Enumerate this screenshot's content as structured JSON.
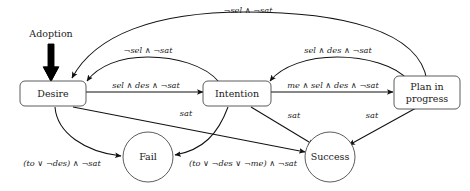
{
  "diagram": {
    "entry": {
      "label": "Adoption",
      "target": "Desire"
    },
    "nodes": [
      {
        "id": "desire",
        "label": "Desire",
        "shape": "rounded-box",
        "x": 52,
        "y": 94
      },
      {
        "id": "intention",
        "label": "Intention",
        "shape": "rounded-box",
        "x": 237,
        "y": 94
      },
      {
        "id": "plan",
        "label": "Plan in",
        "label2": "progress",
        "shape": "rounded-box",
        "x": 427,
        "y": 94
      },
      {
        "id": "fail",
        "label": "Fail",
        "shape": "circle",
        "x": 148,
        "y": 157
      },
      {
        "id": "success",
        "label": "Success",
        "shape": "circle",
        "x": 330,
        "y": 157
      }
    ],
    "edges": [
      {
        "id": "desire-to-intention",
        "from": "desire",
        "to": "intention",
        "label": "sel ∧ des ∧ ¬sat"
      },
      {
        "id": "intention-to-desire",
        "from": "intention",
        "to": "desire",
        "label": "¬sel ∧ ¬sat"
      },
      {
        "id": "intention-to-plan",
        "from": "intention",
        "to": "plan",
        "label": "me ∧ sel ∧ des ∧ ¬sat"
      },
      {
        "id": "plan-to-intention",
        "from": "plan",
        "to": "intention",
        "label": "sel ∧ des ∧ ¬sat"
      },
      {
        "id": "plan-to-desire",
        "from": "plan",
        "to": "desire",
        "label": "¬sel ∧ ¬sat"
      },
      {
        "id": "desire-to-fail",
        "from": "desire",
        "to": "fail",
        "label": "(to ∨ ¬des) ∧ ¬sat"
      },
      {
        "id": "intention-to-fail",
        "from": "intention",
        "to": "fail",
        "label": "(to ∨ ¬des ∨ ¬me) ∧ ¬sat"
      },
      {
        "id": "desire-to-success",
        "from": "desire",
        "to": "success",
        "label": "sat"
      },
      {
        "id": "intention-to-success",
        "from": "intention",
        "to": "success",
        "label": "sat"
      },
      {
        "id": "plan-to-success",
        "from": "plan",
        "to": "success",
        "label": "sat"
      }
    ],
    "colors": {
      "stroke": "#111111",
      "node_stroke": "#4a4a4a",
      "text": "#1a1a1a",
      "background": "#ffffff"
    }
  }
}
